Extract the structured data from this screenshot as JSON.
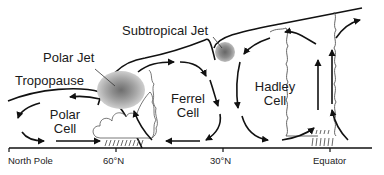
{
  "diagram": {
    "labels": {
      "subtropical_jet": "Subtropical Jet",
      "polar_jet": "Polar Jet",
      "tropopause": "Tropopause",
      "polar_cell_line1": "Polar",
      "polar_cell_line2": "Cell",
      "ferrel_cell_line1": "Ferrel",
      "ferrel_cell_line2": "Cell",
      "hadley_cell_line1": "Hadley",
      "hadley_cell_line2": "Cell"
    },
    "axis": {
      "ticks": [
        {
          "label": "North Pole"
        },
        {
          "label": "60°N"
        },
        {
          "label": "30°N"
        },
        {
          "label": "Equator"
        }
      ]
    },
    "colors": {
      "line": "#111111",
      "thin_line": "#555555",
      "jet_outer": "#c8c8c8",
      "jet_mid": "#a8a8a8",
      "jet_inner": "#8a8a8a",
      "jet_core": "#707070"
    }
  }
}
